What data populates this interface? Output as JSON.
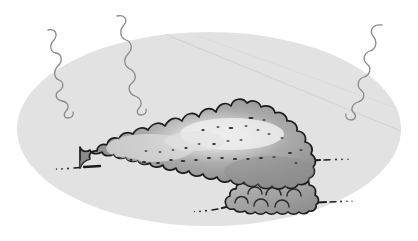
{
  "illustration": {
    "title": "Cumulus cloud with falling squiggly lines inside an oval vignette",
    "subject": "cloud",
    "style": "hand-drawn pen and ink with grayscale wash"
  },
  "canvas": {
    "width": 418,
    "height": 241,
    "background_color": "#ffffff"
  },
  "background_oval": {
    "name": "oval-backdrop",
    "center_x": 209,
    "center_y": 129,
    "radius_x": 192,
    "radius_y": 97,
    "fill_color": "#e2e2e2",
    "crease_line_color": "#d3d3d3",
    "crease_label": "faint diagonal fold crease"
  },
  "squiggles": [
    {
      "name": "squiggle-left",
      "label": "wavy falling line left",
      "stroke_color": "#8a8a8a",
      "stroke_width": 1.3,
      "top_x": 48,
      "top_y": 30,
      "bottom_x": 103,
      "bottom_y": 116
    },
    {
      "name": "squiggle-middle",
      "label": "wavy falling line middle",
      "stroke_color": "#8a8a8a",
      "stroke_width": 1.3,
      "top_x": 117,
      "top_y": 16,
      "bottom_x": 163,
      "bottom_y": 109
    },
    {
      "name": "squiggle-right",
      "label": "wavy falling line right",
      "stroke_color": "#8a8a8a",
      "stroke_width": 1.3,
      "top_x": 382,
      "top_y": 25,
      "bottom_x": 309,
      "bottom_y": 117
    }
  ],
  "main_cloud": {
    "name": "main-cloud",
    "label": "large cumulus cloud mass",
    "outline_color": "#1c1c1c",
    "outline_width": 1.6,
    "fill_dark": "#8e8e8e",
    "fill_mid": "#a6a6a6",
    "fill_light": "#e8e8e8",
    "speckle_color": "#2b2b2b",
    "speckle_count": 34,
    "bounds": {
      "x": 78,
      "y": 99,
      "width": 240,
      "height": 86
    }
  },
  "lower_cloud": {
    "name": "lower-cloud",
    "label": "smaller cloud puff lower right",
    "outline_color": "#1c1c1c",
    "outline_width": 1.6,
    "fill_dark": "#909090",
    "fill_light": "#c8c8c8",
    "arc_color": "#2b2b2b",
    "arc_count": 8,
    "bounds": {
      "x": 222,
      "y": 152,
      "width": 100,
      "height": 56
    }
  },
  "tails": [
    {
      "name": "tail-left",
      "label": "dashed wind tail extending left from main cloud",
      "color": "#1c1c1c",
      "start_x": 56,
      "start_y": 168,
      "end_x": 100,
      "end_y": 165
    },
    {
      "name": "tail-right",
      "label": "dashed wind tail extending right from main cloud",
      "color": "#1c1c1c",
      "start_x": 300,
      "start_y": 161,
      "end_x": 350,
      "end_y": 160
    },
    {
      "name": "tail-lower-left",
      "label": "dashed wind tail extending left from lower cloud",
      "color": "#1c1c1c",
      "start_x": 193,
      "start_y": 211,
      "end_x": 240,
      "end_y": 204
    },
    {
      "name": "tail-lower-right",
      "label": "dashed wind tail extending right from lower cloud",
      "color": "#1c1c1c",
      "start_x": 310,
      "start_y": 203,
      "end_x": 352,
      "end_y": 202
    }
  ]
}
